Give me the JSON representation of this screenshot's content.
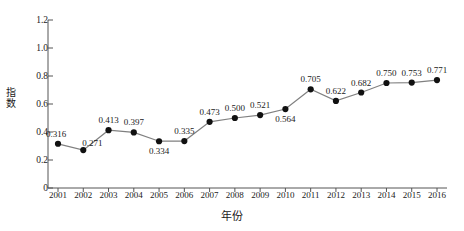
{
  "chart_data": {
    "type": "line",
    "title": "",
    "xlabel": "年份",
    "ylabel": "指数",
    "categories": [
      "2001",
      "2002",
      "2003",
      "2004",
      "2005",
      "2006",
      "2007",
      "2008",
      "2009",
      "2010",
      "2011",
      "2012",
      "2013",
      "2014",
      "2015",
      "2016"
    ],
    "values": [
      0.316,
      0.271,
      0.413,
      0.397,
      0.334,
      0.335,
      0.473,
      0.5,
      0.521,
      0.564,
      0.705,
      0.622,
      0.682,
      0.75,
      0.753,
      0.771
    ],
    "point_labels": [
      "0.316",
      "0.271",
      "0.413",
      "0.397",
      "0.334",
      "0.335",
      "0.473",
      "0.500",
      "0.521",
      "0.564",
      "0.705",
      "0.622",
      "0.682",
      "0.750",
      "0.753",
      "0.771"
    ],
    "label_positions": [
      "above-left",
      "above-right",
      "above",
      "above",
      "below",
      "above",
      "above",
      "above",
      "above",
      "below",
      "above",
      "above",
      "above",
      "above",
      "above",
      "above"
    ],
    "ylim": [
      0,
      1.2
    ],
    "yticks": [
      0,
      0.2,
      0.4,
      0.6,
      0.8,
      1.0,
      1.2
    ],
    "ytick_labels": [
      "0",
      "0.2",
      "0.4",
      "0.6",
      "0.8",
      "1.0",
      "1.2"
    ],
    "grid": false,
    "legend": null,
    "marker": "filled-circle",
    "colors": {
      "line": "#808080",
      "marker": "#111111",
      "axis": "#555555",
      "text": "#1a1a1a"
    }
  }
}
